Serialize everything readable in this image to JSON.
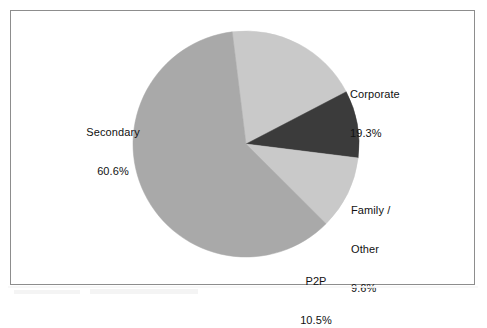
{
  "figure": {
    "frame_visible": true,
    "frame_color": "#8d8d8d",
    "background": "#ffffff"
  },
  "chart_data": {
    "type": "pie",
    "title": "",
    "subtitle": "",
    "xlabel": "",
    "ylabel": "",
    "legend_position": "none",
    "grid": false,
    "labels_outside": true,
    "value_suffix": "%",
    "categories": [
      "Corporate",
      "Family / Other",
      "P2P",
      "Secondary"
    ],
    "values": [
      19.3,
      10.5,
      60.6,
      9.6
    ],
    "slices": [
      {
        "name": "Corporate",
        "label_line1": "Corporate",
        "label_line2": "",
        "label_line3": "",
        "value": 19.3,
        "value_text": "19.3%",
        "color": "#c9c9c9",
        "start_angle_deg": -7.0,
        "sweep_deg": 69.5
      },
      {
        "name": "Family / Other",
        "label_line1": "Family /",
        "label_line2": "Other",
        "label_line3": "",
        "value": 9.6,
        "value_text": "9.6%",
        "color": "#3b3b3b",
        "start_angle_deg": 62.5,
        "sweep_deg": 34.6
      },
      {
        "name": "P2P",
        "label_line1": "P2P",
        "label_line2": "",
        "label_line3": "",
        "value": 10.5,
        "value_text": "10.5%",
        "color": "#c9c9c9",
        "start_angle_deg": 97.1,
        "sweep_deg": 37.8
      },
      {
        "name": "Secondary",
        "label_line1": "Secondary",
        "label_line2": "",
        "label_line3": "",
        "value": 60.6,
        "value_text": "60.6%",
        "color": "#a9a9a9",
        "start_angle_deg": 134.9,
        "sweep_deg": 218.1
      }
    ],
    "geometry": {
      "center_x": 246,
      "center_y": 144,
      "radius": 113
    }
  },
  "labels": {
    "corporate": {
      "name": "Corporate",
      "value": "19.3%"
    },
    "secondary": {
      "name": "Secondary",
      "value": "60.6%"
    },
    "family_other": {
      "line1": "Family /",
      "line2": "Other",
      "value": "9.6%"
    },
    "p2p": {
      "name": "P2P",
      "value": "10.5%"
    }
  }
}
